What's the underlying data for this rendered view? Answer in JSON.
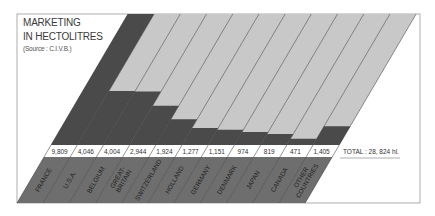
{
  "chart_data": {
    "type": "bar",
    "subtitle": "(Source : C.I.V.B.)",
    "categories": [
      "FRANCE",
      "U.S.A.",
      "BELGIUM",
      "GREAT-BRITAIN",
      "SWITZERLAND",
      "HOLLAND",
      "GERMANY",
      "DENMARK",
      "JAPAN",
      "CANADA",
      "OTHER COUNTRIES"
    ],
    "values": [
      9809,
      4046,
      4004,
      2944,
      1924,
      1277,
      1151,
      974,
      819,
      471,
      1405
    ],
    "value_labels": [
      "9,809",
      "4,046",
      "4,004",
      "2,944",
      "1,924",
      "1,277",
      "1,151",
      "974",
      "819",
      "471",
      "1,405"
    ],
    "total_label": "TOTAL : 28, 824 hl.",
    "unit": "hl",
    "xlabel": "",
    "ylabel": "",
    "ylim": [
      0,
      9809
    ],
    "grid": false,
    "legend": null,
    "style": "slanted (oblique) bar columns"
  },
  "header": {
    "line1": "MARKETING",
    "line2": "IN HECTOLITRES",
    "source": "(Source : C.I.V.B.)"
  },
  "colors": {
    "bar_dark": "#4a4a4a",
    "bar_light": "#c8c8c8",
    "label_band": "#6e6e6e",
    "frame": "#9a9a9a",
    "text": "#3a3a3a"
  }
}
